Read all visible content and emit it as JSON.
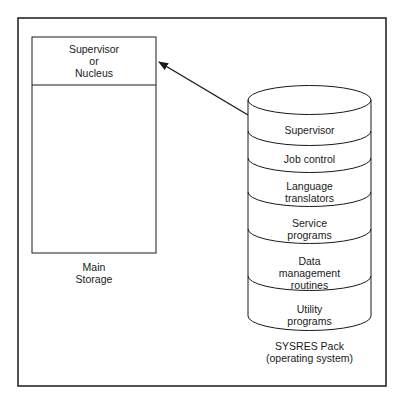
{
  "main_storage": {
    "top_section_lines": [
      "Supervisor",
      "or",
      "Nucleus"
    ],
    "caption_lines": [
      "Main",
      "Storage"
    ]
  },
  "sysres_pack": {
    "layers": [
      {
        "lines": [
          "Supervisor"
        ]
      },
      {
        "lines": [
          "Job control"
        ]
      },
      {
        "lines": [
          "Language",
          "translators"
        ]
      },
      {
        "lines": [
          "Service",
          "programs"
        ]
      },
      {
        "lines": [
          "Data",
          "management",
          "routines"
        ]
      },
      {
        "lines": [
          "Utility",
          "programs"
        ]
      }
    ],
    "caption_lines": [
      "SYSRES Pack",
      "(operating system)"
    ]
  },
  "arrow": {
    "from": "sysres-supervisor-layer",
    "to": "main-storage-supervisor"
  }
}
